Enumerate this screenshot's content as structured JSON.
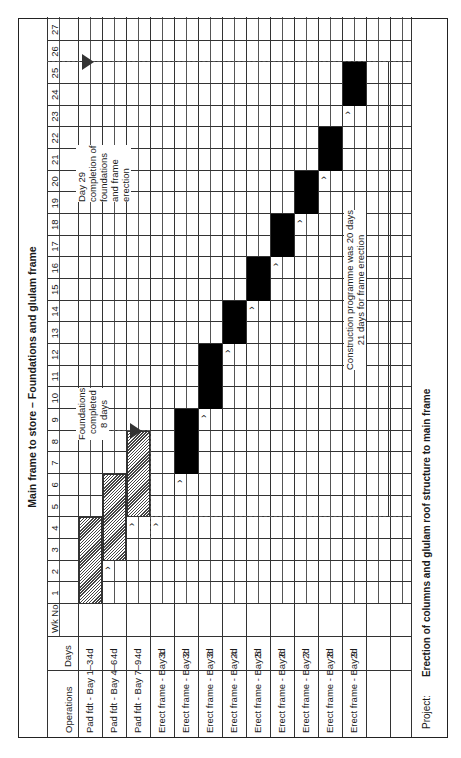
{
  "title": "Main frame to store – Foundations and glulam frame",
  "header": {
    "operations_label": "Operations",
    "wk_no_label": "Wk No",
    "days_label": "Days",
    "weeks": [
      "1",
      "2",
      "3",
      "4",
      "5",
      "6",
      "7",
      "8",
      "9",
      "10",
      "11",
      "12",
      "13",
      "14",
      "15",
      "16",
      "17",
      "18",
      "19",
      "20",
      "21",
      "22",
      "23",
      "24",
      "25",
      "26",
      "27"
    ]
  },
  "rows": [
    {
      "operation": "Pad fdt - Bay 1–3",
      "days": "4d"
    },
    {
      "operation": "Pad fdt - Bay 4–6",
      "days": "4d"
    },
    {
      "operation": "Pad fdt - Bay 7–9",
      "days": "4d"
    },
    {
      "operation": "Erect frame - Bay 1",
      "days": "3d"
    },
    {
      "operation": "Erect frame - Bay 2",
      "days": "3d"
    },
    {
      "operation": "Erect frame - Bay 3",
      "days": "3d"
    },
    {
      "operation": "Erect frame - Bay 4",
      "days": "2d"
    },
    {
      "operation": "Erect frame - Bay 5",
      "days": "2d"
    },
    {
      "operation": "Erect frame - Bay 6",
      "days": "2d"
    },
    {
      "operation": "Erect frame - Bay 7",
      "days": "2d"
    },
    {
      "operation": "Erect frame - Bay 8",
      "days": "2d"
    },
    {
      "operation": "Erect frame - Bay 9",
      "days": "2d"
    }
  ],
  "annotations": {
    "foundations": [
      "Foundations",
      "completed",
      "8 days"
    ],
    "completion": [
      "Day 29",
      "completion of",
      "foundations",
      "and frame",
      "erection"
    ],
    "programme": [
      "Construction programme was 20 days",
      "21 days for frame erection"
    ]
  },
  "project": {
    "label": "Project:",
    "value": "Erection of columns and glulam roof structure to main frame"
  },
  "chart_data": {
    "type": "gantt",
    "title": "Main frame to store – Foundations and glulam frame",
    "xlabel": "Wk No (day)",
    "x_range": [
      1,
      27
    ],
    "tasks": [
      {
        "name": "Pad fdt - Bay 1–3",
        "duration": "4d",
        "start": 1,
        "end": 4,
        "style": "hatched"
      },
      {
        "name": "Pad fdt - Bay 4–6",
        "duration": "4d",
        "start": 3,
        "end": 6,
        "style": "hatched"
      },
      {
        "name": "Pad fdt - Bay 7–9",
        "duration": "4d",
        "start": 5,
        "end": 8,
        "style": "hatched"
      },
      {
        "name": "Erect frame - Bay 1",
        "duration": "3d",
        "start": null,
        "end": null,
        "style": "none"
      },
      {
        "name": "Erect frame - Bay 2",
        "duration": "3d",
        "start": 7,
        "end": 9,
        "style": "solid"
      },
      {
        "name": "Erect frame - Bay 3",
        "duration": "3d",
        "start": 10,
        "end": 12,
        "style": "solid"
      },
      {
        "name": "Erect frame - Bay 4",
        "duration": "2d",
        "start": 13,
        "end": 14,
        "style": "solid"
      },
      {
        "name": "Erect frame - Bay 5",
        "duration": "2d",
        "start": 15,
        "end": 16,
        "style": "solid"
      },
      {
        "name": "Erect frame - Bay 6",
        "duration": "2d",
        "start": 17,
        "end": 18,
        "style": "solid"
      },
      {
        "name": "Erect frame - Bay 7",
        "duration": "2d",
        "start": 19,
        "end": 20,
        "style": "solid"
      },
      {
        "name": "Erect frame - Bay 8",
        "duration": "2d",
        "start": 21,
        "end": 22,
        "style": "solid"
      },
      {
        "name": "Erect frame - Bay 9",
        "duration": "2d",
        "start": 24,
        "end": 25,
        "style": "solid"
      }
    ],
    "milestones": [
      {
        "label": "Foundations completed 8 days",
        "at": 8
      },
      {
        "label": "Day 29 completion of foundations and frame erection",
        "at": 25
      }
    ],
    "annotations": [
      "Construction programme was 20 days",
      "21 days for frame erection"
    ]
  }
}
